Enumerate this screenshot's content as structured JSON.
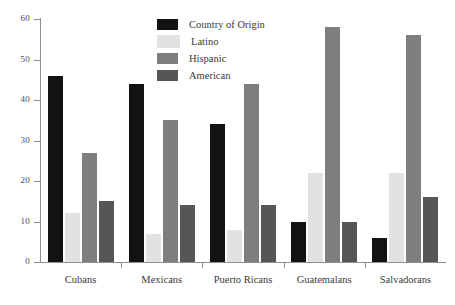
{
  "chart_data": {
    "type": "bar",
    "title": "",
    "subtitle": "",
    "xlabel": "",
    "ylabel": "",
    "ylim": [
      0,
      60
    ],
    "yticks": [
      0,
      10,
      20,
      30,
      40,
      50,
      60
    ],
    "grid": false,
    "legend_position": "top-center",
    "categories": [
      "Cubans",
      "Mexicans",
      "Puerto Ricans",
      "Guatemalans",
      "Salvadorans"
    ],
    "series": [
      {
        "name": "Country of Origin",
        "color": "#121212",
        "values": [
          46,
          44,
          34,
          10,
          6
        ]
      },
      {
        "name": "Latino",
        "color": "#e2e2e2",
        "values": [
          12,
          7,
          8,
          22,
          22
        ]
      },
      {
        "name": "Hispanic",
        "color": "#7e7e7e",
        "values": [
          27,
          35,
          44,
          58,
          56
        ]
      },
      {
        "name": "American",
        "color": "#565656",
        "values": [
          15,
          14,
          14,
          10,
          16
        ]
      }
    ]
  },
  "axis": {
    "tick_labels": [
      "60",
      "50",
      "40",
      "30",
      "20",
      "10",
      "0"
    ]
  },
  "legend": {
    "items": [
      {
        "label": "Country of Origin",
        "color": "#121212"
      },
      {
        "label": "Latino",
        "color": "#e2e2e2"
      },
      {
        "label": "Hispanic",
        "color": "#7e7e7e"
      },
      {
        "label": "American",
        "color": "#565656"
      }
    ]
  }
}
